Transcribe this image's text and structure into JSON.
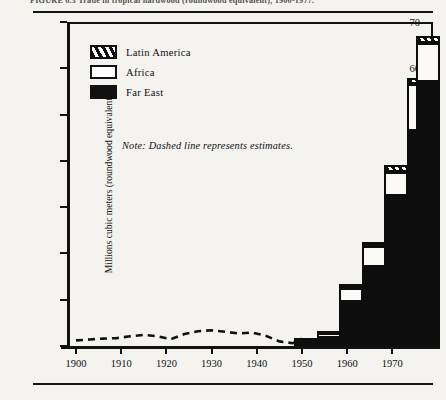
{
  "caption": {
    "text": "FIGURE 6.3  Trade in tropical hardwood (roundwood equivalent), 1900-1977."
  },
  "chart_data": {
    "type": "bar",
    "title": "",
    "subtitle": "",
    "xlabel": "",
    "ylabel": "Millions cubic meters (roundwood equivalent)",
    "xlim": [
      1898,
      1979
    ],
    "ylim": [
      0,
      70
    ],
    "ytick_values": [
      0,
      10,
      20,
      30,
      40,
      50,
      60,
      70
    ],
    "ytick_labels": [
      "",
      "10",
      "20",
      "30",
      "40",
      "50",
      "60",
      "70"
    ],
    "xtick_values": [
      1900,
      1910,
      1920,
      1930,
      1940,
      1950,
      1960,
      1970
    ],
    "xtick_labels": [
      "1900",
      "1910",
      "1920",
      "1930",
      "1940",
      "1950",
      "1960",
      "1970"
    ],
    "grid": false,
    "legend_position": "upper-left",
    "stacked": true,
    "categories": [
      1950,
      1955,
      1960,
      1965,
      1970,
      1975,
      1977
    ],
    "series": [
      {
        "name": "Far East",
        "fill": "solid-black",
        "values": [
          0.8,
          1.8,
          9.5,
          17.0,
          32.5,
          46.5,
          57.0
        ]
      },
      {
        "name": "Africa",
        "fill": "white",
        "values": [
          0.5,
          1.0,
          3.0,
          4.5,
          5.0,
          10.0,
          8.5
        ]
      },
      {
        "name": "Latin America",
        "fill": "hatched",
        "values": [
          0.4,
          0.5,
          0.8,
          1.0,
          1.5,
          1.5,
          1.5
        ]
      }
    ],
    "totals": [
      1.7,
      3.3,
      13.3,
      22.5,
      39.0,
      58.0,
      67.0
    ],
    "annotations": [
      {
        "text": "Note: Dashed line represents estimates.",
        "style": "italic"
      }
    ],
    "estimate_line": {
      "style": "dashed",
      "label": "estimates",
      "x": [
        1900,
        1903,
        1906,
        1909,
        1912,
        1915,
        1918,
        1921,
        1924,
        1927,
        1930,
        1933,
        1936,
        1939,
        1942,
        1945,
        1948,
        1950
      ],
      "y": [
        1.2,
        1.4,
        1.6,
        1.7,
        2.1,
        2.4,
        2.1,
        1.5,
        2.6,
        3.2,
        3.4,
        3.1,
        2.7,
        2.9,
        2.2,
        1.0,
        0.6,
        1.6
      ]
    }
  },
  "legend": {
    "items": [
      {
        "label": "Latin America",
        "fill": "hatched"
      },
      {
        "label": "Africa",
        "fill": "white"
      },
      {
        "label": "Far East",
        "fill": "solid-black"
      }
    ]
  },
  "colors": {
    "ink": "#111111",
    "paper": "#f4f3f0",
    "fill_white": "#fbfaf7"
  }
}
